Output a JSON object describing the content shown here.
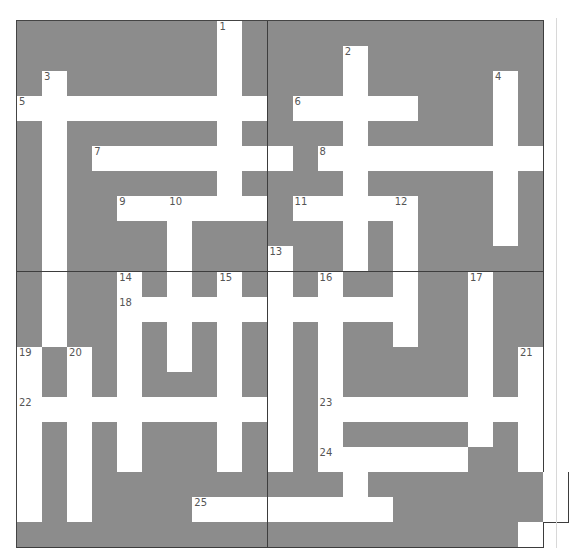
{
  "puzzle": {
    "type": "crossword",
    "rows": 21,
    "cols": 21,
    "colors": {
      "block": "#8c8c8c",
      "open": "#ffffff",
      "gridline": "#3d3d3d",
      "number": "#555555"
    },
    "layout": [
      "########.############",
      "########.####.#######",
      "#.######.####.#####.#",
      "..........#.....###.#",
      "#.######.####.#####.#",
      "#.#........#.........",
      "#.######.####.#####.#",
      "#.##......#.....###.#",
      "#.####.######.#.###.#",
      "#.####.###.##.#.#####",
      "#.##.#.#.#.#.##.##.##",
      "#.##............##.##",
      "#.##.#.#.#.#.##.##.##",
      ".#.#.#.#.#.#.#####.#.",
      ".#.#.###.#.#.#####.#.",
      "...........#.........",
      ".#.#.###.#.#.#####.#.",
      ".#.#.###.#.#......##.",
      ".#.##########.#######.",
      ".#.####........######.",
      "####################."
    ],
    "numbers": [
      {
        "n": "1",
        "r": 0,
        "c": 8
      },
      {
        "n": "2",
        "r": 1,
        "c": 13
      },
      {
        "n": "3",
        "r": 2,
        "c": 1
      },
      {
        "n": "4",
        "r": 2,
        "c": 19
      },
      {
        "n": "5",
        "r": 3,
        "c": 0
      },
      {
        "n": "6",
        "r": 3,
        "c": 11
      },
      {
        "n": "7",
        "r": 5,
        "c": 3
      },
      {
        "n": "8",
        "r": 5,
        "c": 12
      },
      {
        "n": "9",
        "r": 7,
        "c": 4
      },
      {
        "n": "10",
        "r": 7,
        "c": 6
      },
      {
        "n": "11",
        "r": 7,
        "c": 11
      },
      {
        "n": "12",
        "r": 7,
        "c": 15
      },
      {
        "n": "13",
        "r": 9,
        "c": 10
      },
      {
        "n": "14",
        "r": 10,
        "c": 4
      },
      {
        "n": "15",
        "r": 10,
        "c": 8
      },
      {
        "n": "16",
        "r": 10,
        "c": 12
      },
      {
        "n": "17",
        "r": 10,
        "c": 18
      },
      {
        "n": "18",
        "r": 11,
        "c": 4
      },
      {
        "n": "19",
        "r": 13,
        "c": 0
      },
      {
        "n": "20",
        "r": 13,
        "c": 2
      },
      {
        "n": "21",
        "r": 13,
        "c": 20
      },
      {
        "n": "22",
        "r": 15,
        "c": 0
      },
      {
        "n": "23",
        "r": 15,
        "c": 12
      },
      {
        "n": "24",
        "r": 17,
        "c": 12
      },
      {
        "n": "25",
        "r": 19,
        "c": 7
      }
    ],
    "across": [
      {
        "n": "5",
        "length": 10
      },
      {
        "n": "6",
        "length": 5
      },
      {
        "n": "7",
        "length": 8
      },
      {
        "n": "8",
        "length": 9
      },
      {
        "n": "9",
        "length": 6
      },
      {
        "n": "11",
        "length": 5
      },
      {
        "n": "18",
        "length": 12
      },
      {
        "n": "22",
        "length": 11
      },
      {
        "n": "23",
        "length": 9
      },
      {
        "n": "24",
        "length": 6
      },
      {
        "n": "25",
        "length": 8
      }
    ],
    "down": [
      {
        "n": "1",
        "length": 8
      },
      {
        "n": "2",
        "length": 9
      },
      {
        "n": "3",
        "length": 11
      },
      {
        "n": "4",
        "length": 7
      },
      {
        "n": "10",
        "length": 7
      },
      {
        "n": "12",
        "length": 6
      },
      {
        "n": "13",
        "length": 9
      },
      {
        "n": "14",
        "length": 8
      },
      {
        "n": "15",
        "length": 8
      },
      {
        "n": "16",
        "length": 10
      },
      {
        "n": "17",
        "length": 7
      },
      {
        "n": "19",
        "length": 7
      },
      {
        "n": "20",
        "length": 7
      },
      {
        "n": "21",
        "length": 8
      }
    ]
  }
}
